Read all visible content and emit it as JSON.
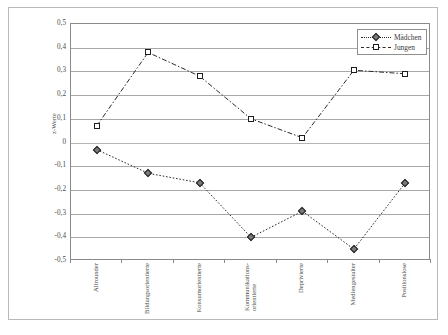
{
  "chart_data": {
    "type": "line",
    "title": "",
    "xlabel": "",
    "ylabel": "z-Werte",
    "ylim": [
      -0.5,
      0.5
    ],
    "grid": true,
    "legend_position": "top-right",
    "ytick_labels": [
      "0,5",
      "0,4",
      "0,3",
      "0,2",
      "0,1",
      "0",
      "-0,1",
      "-0,2",
      "-0,3",
      "-0,4",
      "-0,5"
    ],
    "ytick_values": [
      0.5,
      0.4,
      0.3,
      0.2,
      0.1,
      0,
      -0.1,
      -0.2,
      -0.3,
      -0.4,
      -0.5
    ],
    "categories": [
      "Allrounder",
      "Bildungsorientierte",
      "Konsumorientierte",
      "Kommunikations-orientierte",
      "Deprivierte",
      "Mediengestalter",
      "Positionslose"
    ],
    "categories_lines": [
      [
        "Allrounder"
      ],
      [
        "Bildungsorientierte"
      ],
      [
        "Konsumorientierte"
      ],
      [
        "Kommunikations-",
        "orientierte"
      ],
      [
        "Deprivierte"
      ],
      [
        "Mediengestalter"
      ],
      [
        "Positionslose"
      ]
    ],
    "series": [
      {
        "name": "Mädchen",
        "marker": "diamond",
        "line_style": "dotted",
        "values": [
          -0.03,
          -0.13,
          -0.17,
          -0.4,
          -0.29,
          -0.45,
          -0.17
        ]
      },
      {
        "name": "Jungen",
        "marker": "square",
        "line_style": "dash-dot",
        "values": [
          0.07,
          0.38,
          0.28,
          0.1,
          0.02,
          0.305,
          0.29
        ]
      }
    ]
  },
  "legend": {
    "items": [
      {
        "label": "Mädchen"
      },
      {
        "label": "Jungen"
      }
    ]
  },
  "colors": {
    "line": "#2b2b2b",
    "grid": "#a8a8a8",
    "axis": "#8a8a8a",
    "frame": "#b9b9b9",
    "marker_fill_diamond": "#7a7a7a",
    "marker_fill_square": "#ffffff",
    "background": "#ffffff"
  }
}
